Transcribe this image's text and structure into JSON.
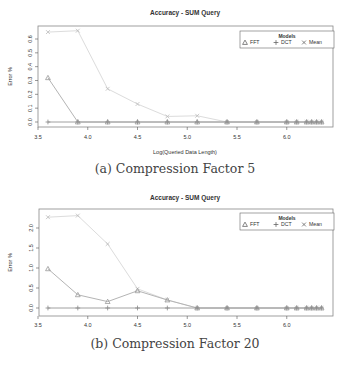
{
  "chart_data": [
    {
      "type": "line",
      "title": "Accuracy - SUM Query",
      "xlabel": "Log(Queried Data Length)",
      "ylabel": "Error %",
      "caption": "(a) Compression Factor 5",
      "xlim": [
        3.5,
        6.5
      ],
      "ylim": [
        0.0,
        0.68
      ],
      "xticks": [
        "3.5",
        "4.0",
        "4.5",
        "5.0",
        "5.5",
        "6.0"
      ],
      "yticks": [
        "0.0",
        "0.1",
        "0.2",
        "0.3",
        "0.4",
        "0.5",
        "0.6"
      ],
      "grid": false,
      "legend": {
        "title": "Models",
        "position": "top-right",
        "entries": [
          "FFT",
          "DCT",
          "Mean"
        ]
      },
      "x": [
        3.6,
        3.9,
        4.2,
        4.5,
        4.8,
        5.1,
        5.4,
        5.7,
        6.0,
        6.1,
        6.2,
        6.25,
        6.3,
        6.35
      ],
      "series": [
        {
          "name": "FFT",
          "marker": "triangle",
          "color": "#b4b4b4",
          "values": [
            0.32,
            0.0,
            0.0,
            0.0,
            0.0,
            0.0,
            0.0,
            0.0,
            0.0,
            0.0,
            0.0,
            0.0,
            0.0,
            0.0
          ]
        },
        {
          "name": "DCT",
          "marker": "plus",
          "color": "#a0a0a0",
          "values": [
            0.0,
            0.0,
            0.0,
            0.0,
            0.0,
            0.0,
            0.0,
            0.0,
            0.0,
            0.0,
            0.0,
            0.0,
            0.0,
            0.0
          ]
        },
        {
          "name": "Mean",
          "marker": "x",
          "color": "#dcdcdc",
          "values": [
            0.65,
            0.66,
            0.24,
            0.13,
            0.04,
            0.045,
            0.0,
            0.0,
            0.0,
            0.0,
            0.0,
            0.0,
            0.0,
            0.0
          ]
        }
      ]
    },
    {
      "type": "line",
      "title": "Accuracy - SUM Query",
      "xlabel": "Log(Queried Data Length)",
      "ylabel": "Error %",
      "caption": "(b) Compression Factor 20",
      "xlim": [
        3.5,
        6.5
      ],
      "ylim": [
        0.0,
        2.4
      ],
      "xticks": [
        "3.5",
        "4.0",
        "4.5",
        "5.0",
        "5.5",
        "6.0"
      ],
      "yticks": [
        "0.0",
        "0.5",
        "1.0",
        "1.5",
        "2.0"
      ],
      "grid": false,
      "legend": {
        "title": "Models",
        "position": "top-right",
        "entries": [
          "FFT",
          "DCT",
          "Mean"
        ]
      },
      "x": [
        3.6,
        3.9,
        4.2,
        4.5,
        4.8,
        5.1,
        5.4,
        5.7,
        6.0,
        6.1,
        6.2,
        6.25,
        6.3,
        6.35
      ],
      "series": [
        {
          "name": "FFT",
          "marker": "triangle",
          "color": "#b4b4b4",
          "values": [
            0.98,
            0.33,
            0.16,
            0.43,
            0.2,
            0.0,
            0.0,
            0.0,
            0.0,
            0.0,
            0.0,
            0.0,
            0.0,
            0.0
          ]
        },
        {
          "name": "DCT",
          "marker": "plus",
          "color": "#a0a0a0",
          "values": [
            0.0,
            0.0,
            0.0,
            0.0,
            0.0,
            0.0,
            0.0,
            0.0,
            0.0,
            0.0,
            0.0,
            0.0,
            0.0,
            0.0
          ]
        },
        {
          "name": "Mean",
          "marker": "x",
          "color": "#dcdcdc",
          "values": [
            2.27,
            2.31,
            1.6,
            0.48,
            0.2,
            0.0,
            0.0,
            0.0,
            0.0,
            0.0,
            0.0,
            0.0,
            0.0,
            0.0
          ]
        }
      ]
    }
  ]
}
